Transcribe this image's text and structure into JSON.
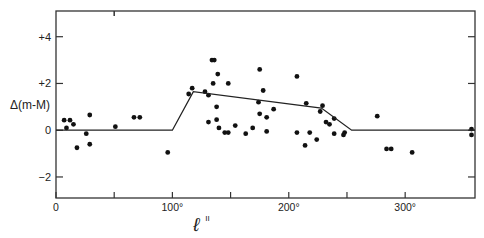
{
  "chart_data": {
    "type": "scatter",
    "title": "",
    "xlabel": "l^II",
    "xlabel_main": "ℓ",
    "xlabel_sup": "II",
    "ylabel": "Δ(m-M)",
    "xlim": [
      0,
      360
    ],
    "ylim": [
      -2.9,
      5.1
    ],
    "grid": false,
    "legend": null,
    "x_ticks": [
      {
        "value": 0,
        "label": "0"
      },
      {
        "value": 50,
        "label": ""
      },
      {
        "value": 100,
        "label": "100°"
      },
      {
        "value": 150,
        "label": ""
      },
      {
        "value": 200,
        "label": "200°"
      },
      {
        "value": 250,
        "label": ""
      },
      {
        "value": 300,
        "label": "300°"
      }
    ],
    "y_ticks": [
      {
        "value": 4,
        "label": "+4"
      },
      {
        "value": 2,
        "label": "+2"
      },
      {
        "value": 0,
        "label": "0"
      },
      {
        "value": -2,
        "label": "-2"
      }
    ],
    "series": [
      {
        "name": "observations",
        "kind": "scatter",
        "points": [
          [
            7,
            0.43
          ],
          [
            12,
            0.43
          ],
          [
            9,
            0.1
          ],
          [
            15,
            0.25
          ],
          [
            18,
            -0.75
          ],
          [
            26,
            -0.15
          ],
          [
            29,
            0.65
          ],
          [
            29,
            -0.6
          ],
          [
            51,
            0.15
          ],
          [
            67,
            0.55
          ],
          [
            72,
            0.55
          ],
          [
            96,
            -0.95
          ],
          [
            114,
            1.55
          ],
          [
            117,
            1.8
          ],
          [
            128,
            1.65
          ],
          [
            131,
            1.5
          ],
          [
            134,
            3.0
          ],
          [
            136,
            3.0
          ],
          [
            139,
            2.4
          ],
          [
            135,
            2.0
          ],
          [
            148,
            2.0
          ],
          [
            131,
            0.35
          ],
          [
            138,
            1.0
          ],
          [
            138,
            0.45
          ],
          [
            140,
            0.1
          ],
          [
            145,
            -0.1
          ],
          [
            148,
            -0.1
          ],
          [
            154,
            0.2
          ],
          [
            163,
            -0.15
          ],
          [
            169,
            0.1
          ],
          [
            175,
            2.6
          ],
          [
            178,
            1.7
          ],
          [
            174,
            1.2
          ],
          [
            175,
            0.7
          ],
          [
            181,
            0.55
          ],
          [
            187,
            0.9
          ],
          [
            181,
            -0.05
          ],
          [
            207,
            2.3
          ],
          [
            215,
            1.15
          ],
          [
            207,
            -0.1
          ],
          [
            218,
            -0.1
          ],
          [
            224,
            -0.4
          ],
          [
            214,
            -0.65
          ],
          [
            227,
            0.8
          ],
          [
            229,
            1.05
          ],
          [
            232,
            0.35
          ],
          [
            235,
            0.25
          ],
          [
            239,
            0.5
          ],
          [
            239,
            -0.15
          ],
          [
            248,
            -0.1
          ],
          [
            247,
            -0.2
          ],
          [
            276,
            0.6
          ],
          [
            284,
            -0.8
          ],
          [
            288,
            -0.8
          ],
          [
            306,
            -0.95
          ],
          [
            357,
            0.05
          ],
          [
            357,
            -0.2
          ]
        ]
      },
      {
        "name": "model",
        "kind": "line",
        "points": [
          [
            0,
            0
          ],
          [
            100,
            0
          ],
          [
            118,
            1.65
          ],
          [
            228,
            0.95
          ],
          [
            254,
            0
          ],
          [
            360,
            0
          ]
        ]
      }
    ]
  }
}
